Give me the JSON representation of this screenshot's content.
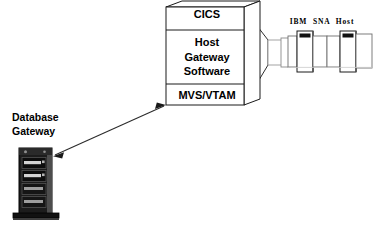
{
  "diagram": {
    "background_color": "#ffffff",
    "stroke_color": "#000000",
    "line_color": "#3a3a3a",
    "chassis_dark": "#1a1a1a",
    "chassis_mid": "#4a4a4a",
    "chassis_light": "#c8c8c8",
    "nodes": {
      "host_stack": {
        "name": "Host Gateway Stack",
        "layers": [
          {
            "id": "cics",
            "label": "CICS"
          },
          {
            "id": "host_gateway_software",
            "label": "Host\nGateway\nSoftware"
          },
          {
            "id": "mvs_vtam",
            "label": "MVS/VTAM"
          }
        ]
      },
      "mainframe": {
        "name": "IBM SNA Host",
        "caption": "IBM  SNA  Host"
      },
      "database_gateway": {
        "name": "Database Gateway",
        "caption": "Database\nGateway"
      }
    },
    "connectors": [
      {
        "id": "gateway-to-mvs",
        "from": "database_gateway",
        "to": "mvs_vtam",
        "style": "double-headed-arrow"
      },
      {
        "id": "stack-to-mainframe",
        "from": "host_stack",
        "to": "mainframe",
        "style": "funnel-wedge"
      }
    ]
  }
}
